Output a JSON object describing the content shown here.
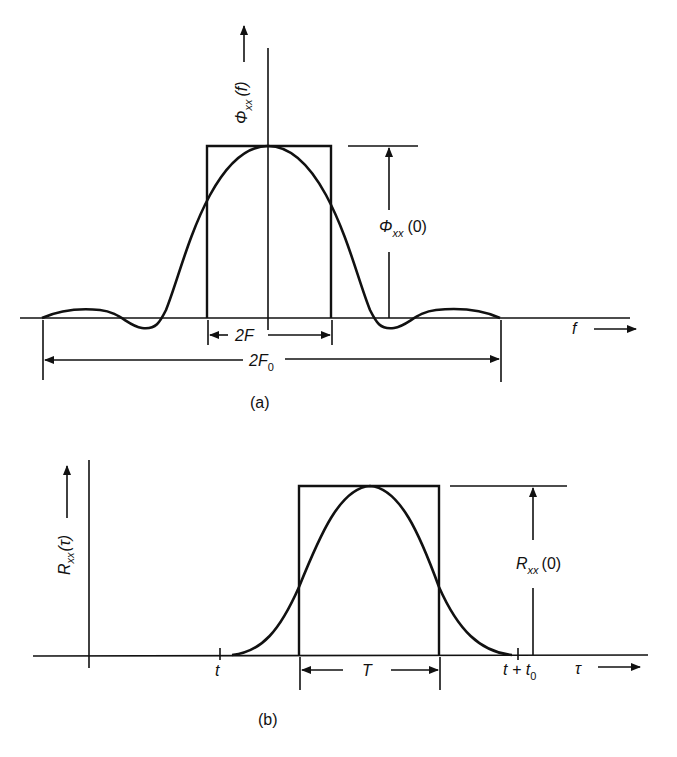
{
  "figure_a": {
    "caption": "(a)",
    "y_axis_label": "Φ",
    "y_axis_label_sub": "xx",
    "y_axis_label_arg": "(f)",
    "peak_label": "Φ",
    "peak_label_sub": "xx",
    "peak_label_arg": "(0)",
    "inner_width_label": "2F",
    "outer_width_label": "2F",
    "outer_width_label_sub": "0",
    "x_axis_label": "f"
  },
  "figure_b": {
    "caption": "(b)",
    "y_axis_label": "R",
    "y_axis_label_sub": "xx",
    "y_axis_label_arg": "(τ)",
    "peak_label": "R",
    "peak_label_sub": "xx",
    "peak_label_arg": "(0)",
    "width_label": "T",
    "start_tick_label": "t",
    "end_tick_label": "t + t",
    "end_tick_label_sub": "0",
    "x_axis_label": "τ"
  }
}
